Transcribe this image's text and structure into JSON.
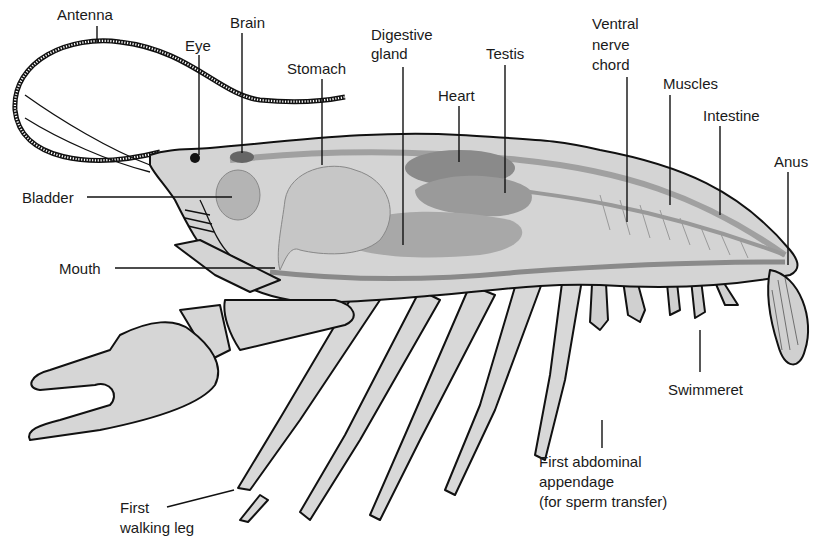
{
  "diagram": {
    "labels": {
      "antenna": "Antenna",
      "eye": "Eye",
      "brain": "Brain",
      "stomach": "Stomach",
      "digestive_gland_1": "Digestive",
      "digestive_gland_2": "gland",
      "testis": "Testis",
      "heart": "Heart",
      "ventral_nerve_1": "Ventral",
      "ventral_nerve_2": "nerve",
      "ventral_nerve_3": "chord",
      "muscles": "Muscles",
      "intestine": "Intestine",
      "anus": "Anus",
      "bladder": "Bladder",
      "mouth": "Mouth",
      "swimmeret": "Swimmeret",
      "first_abdominal_1": "First abdominal",
      "first_abdominal_2": "appendage",
      "first_abdominal_3": "(for sperm transfer)",
      "first_walking_leg_1": "First",
      "first_walking_leg_2": "walking leg"
    },
    "colors": {
      "ink": "#111111",
      "body_fill": "#d4d4d4",
      "organ_dark": "#8a8a8a",
      "organ_mid": "#b0b0b0",
      "organ_light": "#c8c8c8",
      "background": "#ffffff"
    }
  }
}
